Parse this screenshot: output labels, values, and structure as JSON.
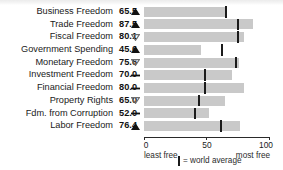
{
  "chart_data": {
    "type": "bar",
    "title": "",
    "xlabel": "",
    "ylabel": "",
    "xlim": [
      0,
      100
    ],
    "grid": false,
    "orientation": "horizontal",
    "categories": [
      "Business Freedom",
      "Trade Freedom",
      "Fiscal Freedom",
      "Government Spending",
      "Monetary Freedom",
      "Investment Freedom",
      "Financial Freedom",
      "Property Rights",
      "Fdm. from Corruption",
      "Labor Freedom"
    ],
    "values": [
      65.5,
      87.5,
      80.1,
      45.6,
      75.6,
      70.0,
      80.0,
      65.0,
      52.0,
      76.4
    ],
    "value_labels": [
      "65.5",
      "87.5",
      "80.1",
      "45.6",
      "75.6",
      "70.0",
      "80.0",
      "65.0",
      "52.0",
      "76.4"
    ],
    "trends": [
      "up",
      "up",
      "down",
      "up",
      "down",
      "flat",
      "flat",
      "down",
      "flat",
      "up"
    ],
    "world_average": [
      65.5,
      75.2,
      74.9,
      62.6,
      73.4,
      48.8,
      48.5,
      43.8,
      40.5,
      61.5
    ],
    "series": [
      {
        "name": "score",
        "values": [
          65.5,
          87.5,
          80.1,
          45.6,
          75.6,
          70.0,
          80.0,
          65.0,
          52.0,
          76.4
        ]
      },
      {
        "name": "world average",
        "values": [
          65.5,
          75.2,
          74.9,
          62.6,
          73.4,
          48.8,
          48.5,
          43.8,
          40.5,
          61.5
        ]
      }
    ],
    "ticks": [
      {
        "value": 0,
        "label": "0"
      },
      {
        "value": 50,
        "label": "50"
      },
      {
        "value": 100,
        "label": "100"
      }
    ],
    "axis_end_labels": {
      "left": "least free",
      "right": "most free"
    },
    "legend": {
      "position": "bottom",
      "marker_label": "= world average"
    },
    "colors": {
      "bar": "#c9c9c9",
      "marker": "#1b1b1b",
      "text": "#1a1a1a"
    }
  }
}
